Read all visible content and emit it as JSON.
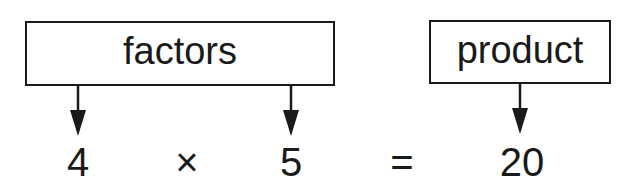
{
  "labels": {
    "factors": "factors",
    "product": "product"
  },
  "equation": {
    "factor1": "4",
    "times": "×",
    "factor2": "5",
    "equals": "=",
    "product": "20"
  },
  "colors": {
    "ink": "#1a1a1a",
    "background": "#ffffff"
  }
}
